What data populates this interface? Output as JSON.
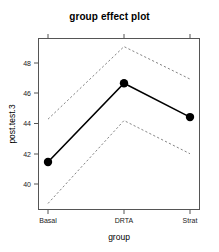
{
  "chart_data": {
    "type": "line",
    "title": "group effect plot",
    "xlabel": "group",
    "ylabel": "post.test.3",
    "categories": [
      "Basal",
      "DRTA",
      "Strat"
    ],
    "series": [
      {
        "name": "fitted",
        "values": [
          41.0,
          46.7,
          44.25
        ],
        "style": "solid",
        "markers": true
      },
      {
        "name": "upper confidence band",
        "values": [
          44.1,
          49.35,
          47.0
        ],
        "style": "dashed",
        "markers": false
      },
      {
        "name": "lower confidence band",
        "values": [
          38.0,
          44.0,
          41.6
        ],
        "style": "dashed",
        "markers": false
      }
    ],
    "ylim": [
      37.6,
      49.9
    ],
    "yticks": [
      40,
      42,
      44,
      46,
      48
    ],
    "ytick_labels": [
      "40",
      "42",
      "44",
      "46",
      "48"
    ],
    "xticks": [
      0,
      1,
      2
    ],
    "grid": false,
    "legend": null
  },
  "labels": {
    "title": "group effect plot",
    "x_axis_title": "group",
    "y_axis_title": "post.test.3",
    "y0": "40",
    "y1": "42",
    "y2": "44",
    "y3": "46",
    "y4": "48",
    "x0": "Basal",
    "x1": "DRTA",
    "x2": "Strat"
  },
  "colors": {
    "line": "#000000",
    "band": "#777777",
    "frame": "#555555",
    "text": "#000000",
    "background": "#ffffff"
  }
}
